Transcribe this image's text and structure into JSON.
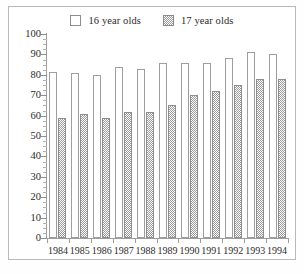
{
  "chart_data": {
    "type": "bar",
    "title": "",
    "subtitle": "",
    "xlabel": "",
    "ylabel": "",
    "categories": [
      "1984",
      "1985",
      "1986",
      "1987",
      "1988",
      "1989",
      "1990",
      "1991",
      "1992",
      "1993",
      "1994"
    ],
    "series": [
      {
        "name": "16 year olds",
        "fill": "white",
        "values": [
          81.5,
          81,
          80,
          84,
          83,
          86,
          86,
          86,
          88,
          91,
          90
        ]
      },
      {
        "name": "17 year olds",
        "fill": "checkered-gray",
        "values": [
          59,
          61,
          59,
          62,
          62,
          65,
          70,
          72,
          75,
          78,
          78
        ]
      }
    ],
    "ylim": [
      0,
      100
    ],
    "ytick_labels": [
      "0",
      "10",
      "20",
      "30",
      "40",
      "50",
      "60",
      "70",
      "80",
      "90",
      "100"
    ],
    "ytick_values": [
      0,
      10,
      20,
      30,
      40,
      50,
      60,
      70,
      80,
      90,
      100
    ],
    "yminor_step": 2.5,
    "grid": false,
    "legend_position": "top-center",
    "colors": {
      "series_16": "#ffffff",
      "series_17": "#9a9a9a",
      "axis": "#9d9d9d",
      "text": "#2b2b2b",
      "frame": "#b9b9b9"
    }
  },
  "legend": {
    "entries": [
      {
        "label": "16 year olds",
        "swatch": "empty-square-icon"
      },
      {
        "label": "17 year olds",
        "swatch": "hatched-square-icon"
      }
    ]
  }
}
